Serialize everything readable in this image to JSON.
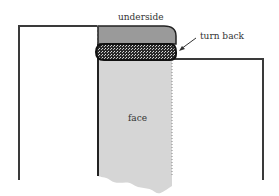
{
  "diagram": {
    "labels": {
      "underside": "underside",
      "turn_back": "turn back",
      "face": "face"
    },
    "colors": {
      "outline": "#3a3a3a",
      "face_fill": "#d6d6d6",
      "underside_fill": "#9a9a9a",
      "turnback_fill": "#2a2a2a"
    }
  }
}
